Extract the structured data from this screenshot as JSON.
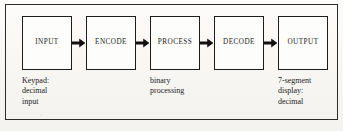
{
  "figure": {
    "background_color": "#fbfaf8",
    "frame_color": "#2b2b2b",
    "box_fill": "#fdfdfb",
    "box_border_color": "#1d1d1d",
    "text_color": "#1a1a1a",
    "arrow_color": "#111111"
  },
  "blocks": [
    {
      "id": "input",
      "label": "INPUT"
    },
    {
      "id": "encode",
      "label": "ENCODE"
    },
    {
      "id": "process",
      "label": "PROCESS"
    },
    {
      "id": "decode",
      "label": "DECODE"
    },
    {
      "id": "output",
      "label": "OUTPUT"
    }
  ],
  "connectors": [
    {
      "id": "input-to-encode",
      "icon": "right-arrow-icon"
    },
    {
      "id": "encode-to-process",
      "icon": "right-arrow-icon"
    },
    {
      "id": "process-to-decode",
      "icon": "right-arrow-icon"
    },
    {
      "id": "decode-to-output",
      "icon": "right-arrow-icon"
    }
  ],
  "captions": [
    {
      "id": "input-caption",
      "text": "Keypad:\ndecimal\ninput"
    },
    {
      "id": "process-caption",
      "text": "binary\nprocessing"
    },
    {
      "id": "output-caption",
      "text": "7-segment\ndisplay:\ndecimal"
    }
  ]
}
